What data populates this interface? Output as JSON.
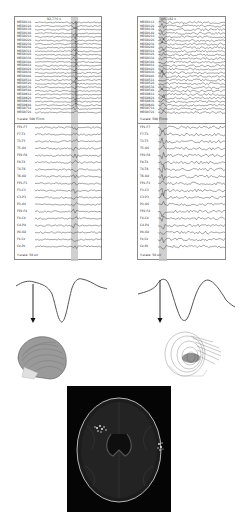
{
  "figure": {
    "left_panel": {
      "title": "92,776 s",
      "meg_channels": [
        "MEG0111",
        "MEG0121",
        "MEG0131",
        "MEG0141",
        "MEG0211",
        "MEG0221",
        "MEG0231",
        "MEG0241",
        "MEG0311",
        "MEG0321",
        "MEG0331",
        "MEG0341",
        "MEG0411",
        "MEG0421",
        "MEG0431",
        "MEG0441",
        "MEG0511",
        "MEG0521",
        "MEG0531",
        "MEG0541",
        "MEG0611",
        "MEG0621",
        "MEG0631",
        "MEG0641",
        "MEG0711",
        "MEG0721"
      ],
      "meg_scale": "Y-scale:   500 fT/cm",
      "eeg_channels": [
        "FP1-F7",
        "F7-T3",
        "T3-T5",
        "T5-O1",
        "FP2-F8",
        "F8-T4",
        "T4-T6",
        "T6-O2",
        "FP1-F3",
        "F3-C3",
        "C3-P3",
        "P3-O1",
        "FP2-F4",
        "F4-C4",
        "C4-P4",
        "P4-O2",
        "Fz-Cz",
        "Cz-Pz"
      ],
      "eeg_scale": "Y-scale:   50 uV"
    },
    "right_panel": {
      "title": "105,182 s",
      "meg_channels": [
        "MEG0111",
        "MEG0121",
        "MEG0131",
        "MEG0141",
        "MEG0211",
        "MEG0221",
        "MEG0231",
        "MEG0241",
        "MEG0311",
        "MEG0321",
        "MEG0331",
        "MEG0341",
        "MEG0411",
        "MEG0421",
        "MEG0431",
        "MEG0441",
        "MEG0511",
        "MEG0521",
        "MEG0531",
        "MEG0541",
        "MEG0611",
        "MEG0621",
        "MEG0631",
        "MEG0641",
        "MEG0711",
        "MEG0721"
      ],
      "meg_scale": "Y-scale:   500 fT/cm",
      "eeg_channels": [
        "FP1-F7",
        "F7-T3",
        "T3-T5",
        "T5-O1",
        "FP2-F8",
        "F8-T4",
        "T4-T6",
        "T6-O2",
        "FP1-F3",
        "F3-C3",
        "C3-P3",
        "P3-O1",
        "FP2-F4",
        "F4-C4",
        "C4-P4",
        "P4-O2",
        "Fz-Cz",
        "Cz-Pz"
      ],
      "eeg_scale": "Y-scale:   50 uV"
    },
    "colors": {
      "trace": "#3a3a3a",
      "highlight": "#b8b8b8",
      "border": "#8a8a8a",
      "mri_bg": "#050505"
    }
  }
}
